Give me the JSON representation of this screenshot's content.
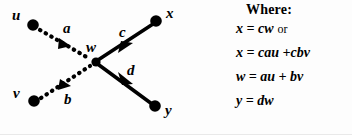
{
  "figure": {
    "type": "signal-flow-graph",
    "graph": {
      "nodes": [
        {
          "id": "u",
          "label": "u",
          "x": 33,
          "y": 25,
          "radius": 5.5
        },
        {
          "id": "v",
          "label": "v",
          "x": 34,
          "y": 101,
          "radius": 5.5
        },
        {
          "id": "w",
          "label": "w",
          "x": 96,
          "y": 62,
          "radius": 5.0
        },
        {
          "id": "x",
          "label": "x",
          "x": 156,
          "y": 21,
          "radius": 5.5
        },
        {
          "id": "y",
          "label": "y",
          "x": 155,
          "y": 106,
          "radius": 5.5
        }
      ],
      "edges": [
        {
          "from": "u",
          "to": "w",
          "label": "a",
          "style": "dotted"
        },
        {
          "from": "v",
          "to": "w",
          "label": "b",
          "style": "dotted"
        },
        {
          "from": "w",
          "to": "x",
          "label": "c",
          "style": "solid"
        },
        {
          "from": "w",
          "to": "y",
          "label": "d",
          "style": "solid"
        }
      ],
      "stroke_color": "#000000"
    }
  },
  "equations": {
    "heading": "Where:",
    "items": [
      {
        "text": "x = cw",
        "conjunction": "or"
      },
      {
        "text": "x = cau +cbv",
        "conjunction": ""
      },
      {
        "text": "w = au + bv",
        "conjunction": ""
      },
      {
        "text": "y = dw",
        "conjunction": ""
      }
    ]
  }
}
